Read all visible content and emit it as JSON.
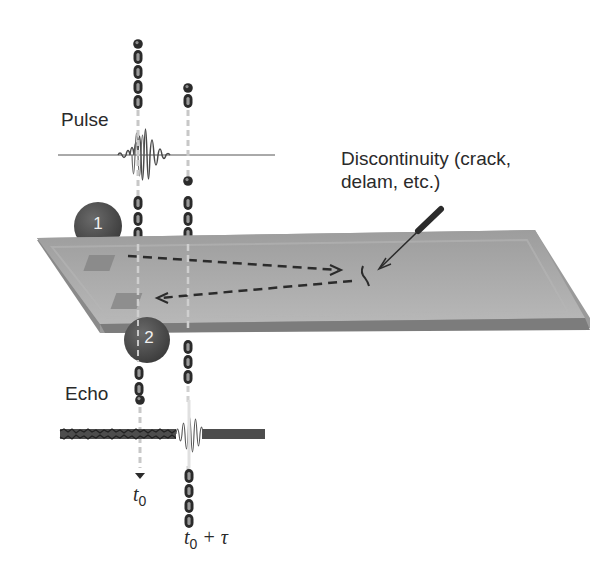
{
  "diagram": {
    "labels": {
      "pulse": "Pulse",
      "echo": "Echo",
      "discontinuity_line1": "Discontinuity (crack,",
      "discontinuity_line2": "delam, etc.)",
      "t0_main": "t",
      "t0_sub": "0",
      "t0tau_main": "t",
      "t0tau_sub": "0",
      "t0tau_suffix": " + τ"
    },
    "markers": [
      {
        "id": "1",
        "label": "1",
        "role": "transmitter"
      },
      {
        "id": "2",
        "label": "2",
        "role": "receiver"
      }
    ],
    "elements": {
      "plate": "test-specimen-plate",
      "transducer_1": "transmitting-transducer-pad",
      "transducer_2": "receiving-transducer-pad",
      "forward_path": "dashed-arrow-to-discontinuity",
      "return_path": "dashed-arrow-to-receiver",
      "discontinuity": "crack-mark",
      "pointer": "discontinuity-pointer-arrow"
    },
    "colors": {
      "plate_top": "#a8a8a8",
      "plate_edge": "#8a8a8a",
      "badge": "#4a4a4a",
      "chain": "#2b2b2b",
      "dash_line": "#c8c8c8",
      "text": "#2a2a2a"
    }
  }
}
